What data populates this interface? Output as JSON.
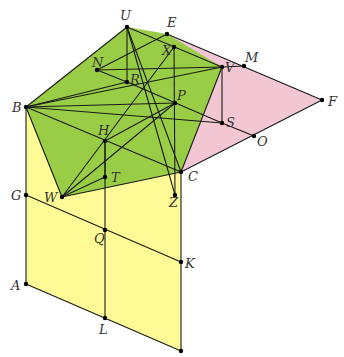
{
  "colors": {
    "yellow": "#fefa96",
    "green": "#9acd46",
    "pink": "#f2c6d2",
    "stroke": "#1a1a1a",
    "label": "#333333"
  },
  "points": {
    "U": [
      127,
      27
    ],
    "E": [
      167,
      34
    ],
    "X": [
      174,
      47
    ],
    "V": [
      222,
      67
    ],
    "M": [
      244,
      66
    ],
    "F": [
      322,
      100
    ],
    "N": [
      97,
      70
    ],
    "R": [
      127,
      82
    ],
    "P": [
      175,
      103
    ],
    "S": [
      222,
      123
    ],
    "O": [
      254,
      136
    ],
    "B": [
      26,
      107
    ],
    "H": [
      105,
      141
    ],
    "T": [
      105,
      177
    ],
    "C": [
      181,
      172
    ],
    "Z": [
      175,
      195
    ],
    "W": [
      62,
      197
    ],
    "G": [
      26,
      195
    ],
    "Q": [
      105,
      230
    ],
    "K": [
      181,
      262
    ],
    "A": [
      26,
      284
    ],
    "L": [
      105,
      318
    ],
    "D": [
      181,
      351
    ]
  },
  "labels": [
    {
      "text": "U",
      "x": 120,
      "y": 20
    },
    {
      "text": "E",
      "x": 167,
      "y": 27
    },
    {
      "text": "X",
      "x": 162,
      "y": 55
    },
    {
      "text": "V",
      "x": 225,
      "y": 72
    },
    {
      "text": "M",
      "x": 245,
      "y": 62
    },
    {
      "text": "F",
      "x": 328,
      "y": 106
    },
    {
      "text": "N",
      "x": 92,
      "y": 67
    },
    {
      "text": "R",
      "x": 130,
      "y": 84
    },
    {
      "text": "P",
      "x": 177,
      "y": 100
    },
    {
      "text": "S",
      "x": 226,
      "y": 127
    },
    {
      "text": "O",
      "x": 257,
      "y": 146
    },
    {
      "text": "B",
      "x": 12,
      "y": 112
    },
    {
      "text": "H",
      "x": 98,
      "y": 135
    },
    {
      "text": "T",
      "x": 111,
      "y": 182
    },
    {
      "text": "C",
      "x": 188,
      "y": 181
    },
    {
      "text": "Z",
      "x": 169,
      "y": 207
    },
    {
      "text": "W",
      "x": 44,
      "y": 202
    },
    {
      "text": "G",
      "x": 11,
      "y": 200
    },
    {
      "text": "Q",
      "x": 94,
      "y": 243
    },
    {
      "text": "K",
      "x": 185,
      "y": 268
    },
    {
      "text": "A",
      "x": 11,
      "y": 290
    },
    {
      "text": "L",
      "x": 99,
      "y": 334
    }
  ],
  "regions": {
    "yellow": [
      "B",
      "C",
      "D",
      "A"
    ],
    "pink": [
      "E",
      "F",
      "C"
    ],
    "green": [
      "B",
      "U",
      "E",
      "V",
      "C",
      "W"
    ]
  },
  "segments": [
    [
      "B",
      "A"
    ],
    [
      "A",
      "D"
    ],
    [
      "D",
      "C"
    ],
    [
      "G",
      "K"
    ],
    [
      "H",
      "L"
    ],
    [
      "E",
      "F"
    ],
    [
      "F",
      "C"
    ],
    [
      "V",
      "M"
    ],
    [
      "S",
      "O"
    ],
    [
      "V",
      "S"
    ],
    [
      "B",
      "U"
    ],
    [
      "U",
      "V"
    ],
    [
      "V",
      "C"
    ],
    [
      "C",
      "W"
    ],
    [
      "W",
      "B"
    ],
    [
      "U",
      "R"
    ],
    [
      "N",
      "R"
    ],
    [
      "N",
      "V"
    ],
    [
      "B",
      "R"
    ],
    [
      "B",
      "V"
    ],
    [
      "B",
      "S"
    ],
    [
      "B",
      "P"
    ],
    [
      "B",
      "C"
    ],
    [
      "U",
      "C"
    ],
    [
      "U",
      "Z"
    ],
    [
      "X",
      "Z"
    ],
    [
      "X",
      "W"
    ],
    [
      "H",
      "P"
    ],
    [
      "W",
      "P"
    ],
    [
      "W",
      "T"
    ],
    [
      "R",
      "S"
    ],
    [
      "H",
      "T"
    ],
    [
      "N",
      "E"
    ]
  ],
  "dots": [
    "U",
    "E",
    "X",
    "V",
    "M",
    "F",
    "N",
    "R",
    "P",
    "S",
    "O",
    "B",
    "H",
    "T",
    "C",
    "Z",
    "W",
    "G",
    "Q",
    "K",
    "A",
    "L",
    "D"
  ]
}
